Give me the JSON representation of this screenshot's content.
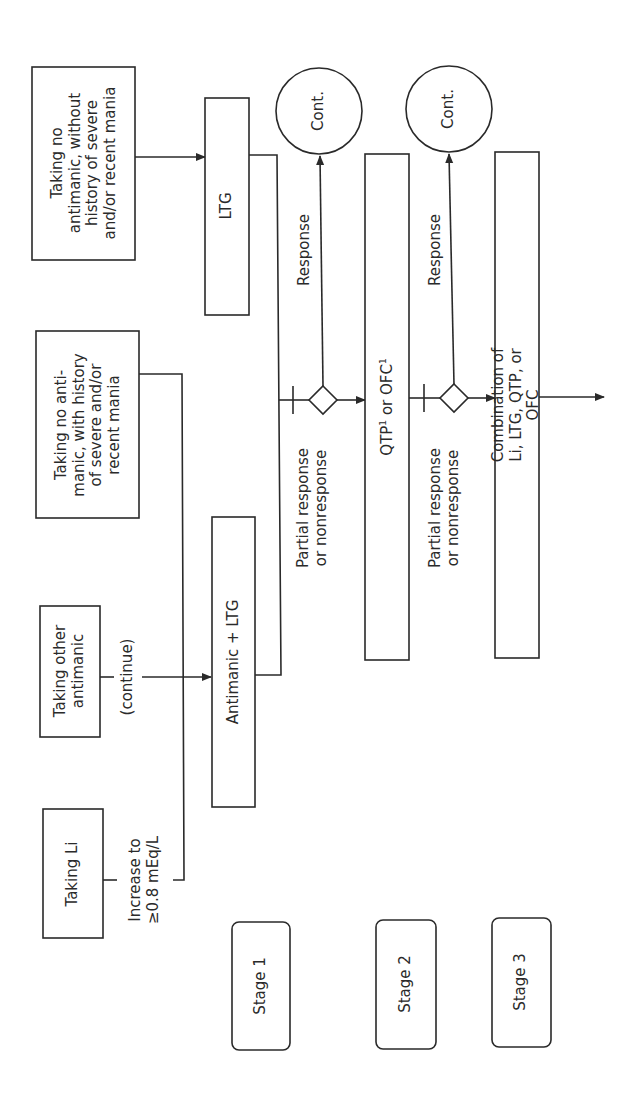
{
  "diagram": {
    "orientation": "rotated-90-ccw",
    "stroke_color": "#2a2a2a",
    "background": "#ffffff",
    "inputs": [
      {
        "id": "no_antimanic_without_history",
        "text": "Taking no\nantimanic, without\nhistory of severe\nand/or recent mania"
      },
      {
        "id": "no_antimanic_with_history",
        "text": "Taking no anti-\nmanic, with history\nof severe and/or\nrecent mania"
      },
      {
        "id": "other_antimanic",
        "text": "Taking other\nantimanic"
      },
      {
        "id": "taking_li",
        "text": "Taking Li"
      }
    ],
    "edge_labels": {
      "continue": "(continue)",
      "increase": "Increase to\n≥0.8 mEq/L",
      "response_1": "Response",
      "response_2": "Response",
      "partial_1": "Partial response\nor nonresponse",
      "partial_2": "Partial response\nor nonresponse"
    },
    "treatments": {
      "ltg": "LTG",
      "antimanic_ltg": "Antimanic + LTG",
      "stage2_qtp": "QTP",
      "stage2_sup1": "1",
      "stage2_or": " or OFC",
      "stage2_sup2": "1",
      "stage3": "Combination of Li, LTG, QTP, or OFC"
    },
    "continue_nodes": [
      "Cont.",
      "Cont."
    ],
    "stages": [
      "Stage 1",
      "Stage 2",
      "Stage 3"
    ]
  }
}
